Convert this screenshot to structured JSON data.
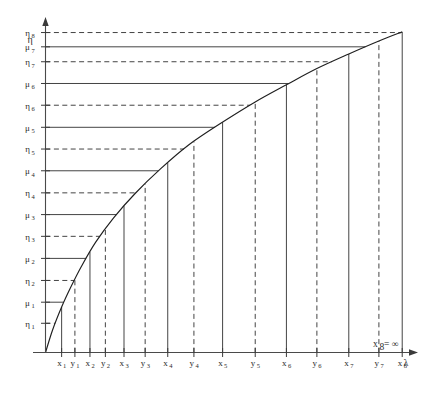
{
  "figure": {
    "background_color": "#ffffff",
    "line_color": "#3a3a3a",
    "curve_color": "#1f1f1f",
    "text_color": "#2b2b2b",
    "axes": {
      "y_axis_label": "η",
      "x_axis_label": "λ"
    },
    "annotation": {
      "text": "x₈ = ∞",
      "base": "x",
      "subscript": "8",
      "equals_infinity": "= ∞"
    }
  },
  "chart_data": {
    "type": "line",
    "title": "",
    "xlabel": "λ",
    "ylabel": "η",
    "grid": false,
    "legend": "none",
    "xlim": [
      0,
      1
    ],
    "ylim": [
      0,
      1
    ],
    "y_ticks": [
      {
        "label": "η₁",
        "base": "η",
        "sub": "1",
        "style": "dashed",
        "value": 0.09
      },
      {
        "label": "μ₁",
        "base": "μ",
        "sub": "1",
        "style": "solid",
        "value": 0.155
      },
      {
        "label": "η₂",
        "base": "η",
        "sub": "2",
        "style": "dashed",
        "value": 0.222
      },
      {
        "label": "μ₂",
        "base": "μ",
        "sub": "2",
        "style": "solid",
        "value": 0.29
      },
      {
        "label": "η₃",
        "base": "η",
        "sub": "3",
        "style": "dashed",
        "value": 0.358
      },
      {
        "label": "μ₃",
        "base": "μ",
        "sub": "3",
        "style": "solid",
        "value": 0.425
      },
      {
        "label": "η₄",
        "base": "η",
        "sub": "4",
        "style": "dashed",
        "value": 0.492
      },
      {
        "label": "μ₄",
        "base": "μ",
        "sub": "4",
        "style": "solid",
        "value": 0.56
      },
      {
        "label": "η₅",
        "base": "η",
        "sub": "5",
        "style": "dashed",
        "value": 0.627
      },
      {
        "label": "μ₅",
        "base": "μ",
        "sub": "5",
        "style": "solid",
        "value": 0.694
      },
      {
        "label": "η₆",
        "base": "η",
        "sub": "6",
        "style": "dashed",
        "value": 0.762
      },
      {
        "label": "μ₆",
        "base": "μ",
        "sub": "6",
        "style": "solid",
        "value": 0.829
      },
      {
        "label": "η₇",
        "base": "η",
        "sub": "7",
        "style": "dashed",
        "value": 0.896
      },
      {
        "label": "μ₇",
        "base": "μ",
        "sub": "7",
        "style": "solid",
        "value": 0.942
      },
      {
        "label": "η₈",
        "base": "η",
        "sub": "8",
        "style": "dashed",
        "value": 0.986
      }
    ],
    "x_ticks": [
      {
        "label": "x₁",
        "base": "x",
        "sub": "1",
        "style": "solid",
        "value": 0.045
      },
      {
        "label": "y₁",
        "base": "y",
        "sub": "1",
        "style": "dashed",
        "value": 0.082
      },
      {
        "label": "x₂",
        "base": "x",
        "sub": "2",
        "style": "solid",
        "value": 0.124
      },
      {
        "label": "y₂",
        "base": "y",
        "sub": "2",
        "style": "dashed",
        "value": 0.167
      },
      {
        "label": "x₃",
        "base": "x",
        "sub": "3",
        "style": "solid",
        "value": 0.219
      },
      {
        "label": "y₃",
        "base": "y",
        "sub": "3",
        "style": "dashed",
        "value": 0.278
      },
      {
        "label": "x₄",
        "base": "x",
        "sub": "4",
        "style": "solid",
        "value": 0.341
      },
      {
        "label": "y₄",
        "base": "y",
        "sub": "4",
        "style": "dashed",
        "value": 0.414
      },
      {
        "label": "x₅",
        "base": "x",
        "sub": "5",
        "style": "solid",
        "value": 0.494
      },
      {
        "label": "y₅",
        "base": "y",
        "sub": "5",
        "style": "dashed",
        "value": 0.585
      },
      {
        "label": "x₆",
        "base": "x",
        "sub": "6",
        "style": "solid",
        "value": 0.672
      },
      {
        "label": "y₆",
        "base": "y",
        "sub": "6",
        "style": "dashed",
        "value": 0.757
      },
      {
        "label": "x₇",
        "base": "x",
        "sub": "7",
        "style": "solid",
        "value": 0.846
      },
      {
        "label": "y₇",
        "base": "y",
        "sub": "7",
        "style": "dashed",
        "value": 0.93
      },
      {
        "label": "x₈",
        "base": "x",
        "sub": "8",
        "style": "solid",
        "value": 0.995
      }
    ],
    "curve": {
      "name": "response-curve",
      "shape": "concave-increasing",
      "points_x": [
        0.0,
        0.02,
        0.045,
        0.07,
        0.1,
        0.14,
        0.19,
        0.25,
        0.32,
        0.4,
        0.49,
        0.585,
        0.672,
        0.757,
        0.846,
        0.93,
        0.995
      ],
      "points_y": [
        0.0,
        0.07,
        0.14,
        0.2,
        0.265,
        0.34,
        0.415,
        0.49,
        0.565,
        0.64,
        0.707,
        0.772,
        0.825,
        0.875,
        0.92,
        0.96,
        0.988
      ]
    }
  }
}
